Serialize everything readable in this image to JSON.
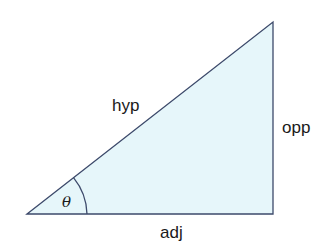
{
  "diagram": {
    "type": "right-triangle",
    "labels": {
      "hypotenuse": "hyp",
      "opposite": "opp",
      "adjacent": "adj",
      "angle": "θ"
    },
    "colors": {
      "fill": "#e6f6fa",
      "stroke": "#3d4a6b",
      "text": "#1a1a1a"
    }
  }
}
